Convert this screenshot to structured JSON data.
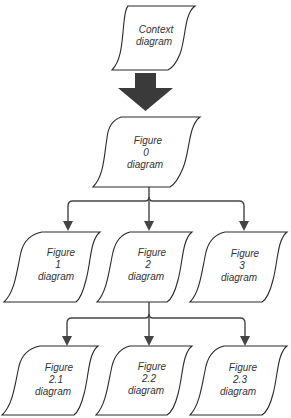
{
  "diagram": {
    "type": "hierarchy / data-flow diagram decomposition",
    "nodes": {
      "context": {
        "line1": "Context",
        "line2": "diagram"
      },
      "fig0": {
        "line1": "Figure",
        "line2": "0",
        "line3": "diagram"
      },
      "fig1": {
        "line1": "Figure",
        "line2": "1",
        "line3": "diagram"
      },
      "fig2": {
        "line1": "Figure",
        "line2": "2",
        "line3": "diagram"
      },
      "fig3": {
        "line1": "Figure",
        "line2": "3",
        "line3": "diagram"
      },
      "fig21": {
        "line1": "Figure",
        "line2": "2.1",
        "line3": "diagram"
      },
      "fig22": {
        "line1": "Figure",
        "line2": "2.2",
        "line3": "diagram"
      },
      "fig23": {
        "line1": "Figure",
        "line2": "2.3",
        "line3": "diagram"
      }
    },
    "edges": [
      {
        "from": "Context diagram",
        "to": "Figure 0 diagram",
        "style": "large-block-arrow"
      },
      {
        "from": "Figure 0 diagram",
        "to": "Figure 1 diagram",
        "style": "thin-arrow"
      },
      {
        "from": "Figure 0 diagram",
        "to": "Figure 2 diagram",
        "style": "thin-arrow"
      },
      {
        "from": "Figure 0 diagram",
        "to": "Figure 3 diagram",
        "style": "thin-arrow"
      },
      {
        "from": "Figure 2 diagram",
        "to": "Figure 2.1 diagram",
        "style": "thin-arrow"
      },
      {
        "from": "Figure 2 diagram",
        "to": "Figure 2.2 diagram",
        "style": "thin-arrow"
      },
      {
        "from": "Figure 2 diagram",
        "to": "Figure 2.3 diagram",
        "style": "thin-arrow"
      }
    ],
    "colors": {
      "background": "#ffffff",
      "stroke": "#2a2a2a",
      "connector": "#444444",
      "big_arrow": "#3a3a3a",
      "text": "#333333"
    }
  }
}
